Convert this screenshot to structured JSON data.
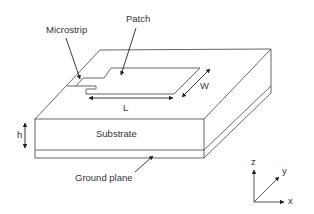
{
  "diagram": {
    "labels": {
      "microstrip": "Microstrip",
      "patch": "Patch",
      "length": "L",
      "width": "W",
      "height": "h",
      "substrate": "Substrate",
      "ground_plane": "Ground plane"
    },
    "axes": {
      "x": "x",
      "y": "y",
      "z": "z"
    },
    "colors": {
      "line": "#555555",
      "text": "#333333",
      "background": "#ffffff"
    }
  }
}
